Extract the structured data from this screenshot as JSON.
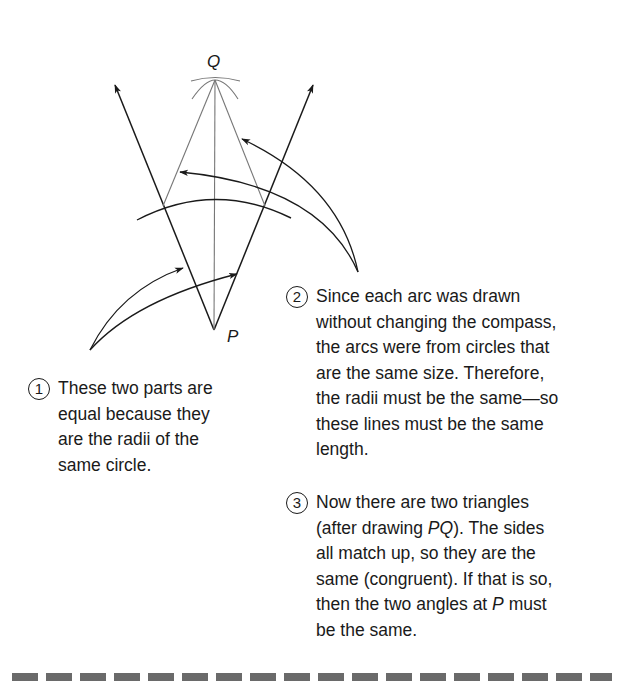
{
  "diagram": {
    "labels": {
      "q": "Q",
      "p": "P"
    },
    "colors": {
      "ink": "#1a1a1a",
      "construction": "#777777"
    },
    "points": {
      "P": [
        214,
        330
      ],
      "Q": [
        215,
        80
      ],
      "left_ray_tip": [
        115,
        85
      ],
      "right_ray_tip": [
        313,
        85
      ],
      "left_arc_intersection": [
        163,
        206
      ],
      "right_arc_intersection": [
        265,
        206
      ]
    }
  },
  "notes": [
    {
      "number": "1",
      "lines": [
        "These two parts are",
        "equal because they",
        "are the radii of the",
        "same circle."
      ]
    },
    {
      "number": "2",
      "lines": [
        "Since each arc was drawn",
        "without changing the compass,",
        "the arcs were from circles that",
        "are the same size. Therefore,",
        "the radii must be the same—so",
        "these lines must be the same",
        "length."
      ]
    },
    {
      "number": "3",
      "lines_pre": "Now there are two triangles",
      "line2_a": "(after drawing ",
      "line2_italic": "PQ",
      "line2_b": "). The sides",
      "line3": "all match up, so they are the",
      "line4": "same (congruent). If that is so,",
      "line5_a": "then the two angles at ",
      "line5_italic": "P",
      "line5_b": " must",
      "line6": "be the same."
    }
  ]
}
